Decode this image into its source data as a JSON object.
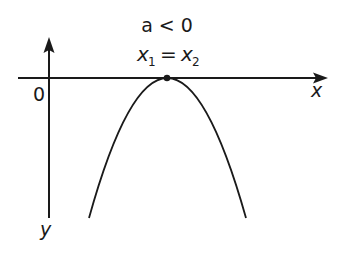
{
  "diagram": {
    "condition_label": "a < 0",
    "roots_label_left": "x",
    "roots_sub_left": "1",
    "roots_equals": "=",
    "roots_label_right": "x",
    "roots_sub_right": "2",
    "origin_label": "0",
    "x_axis_label": "x",
    "y_axis_label": "y",
    "colors": {
      "stroke": "#1a1a1a",
      "background": "#ffffff"
    },
    "vertex": {
      "x": 167,
      "y": 78
    },
    "curve": "downward parabola tangent to x-axis at a single point"
  }
}
